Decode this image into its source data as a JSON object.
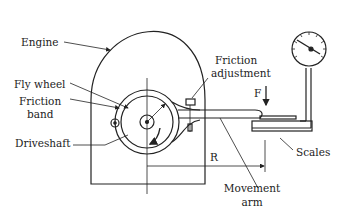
{
  "diagram": {
    "type": "mechanical schematic",
    "labels": {
      "engine": "Engine",
      "fly_wheel": "Fly wheel",
      "friction_band_1": "Friction",
      "friction_band_2": "band",
      "driveshaft": "Driveshaft",
      "friction_adjustment_1": "Friction",
      "friction_adjustment_2": "adjustment",
      "force": "F",
      "radius": "R",
      "scales": "Scales",
      "movement_arm_1": "Movement",
      "movement_arm_2": "arm"
    },
    "colors": {
      "line": "#222222",
      "background": "#ffffff"
    }
  }
}
